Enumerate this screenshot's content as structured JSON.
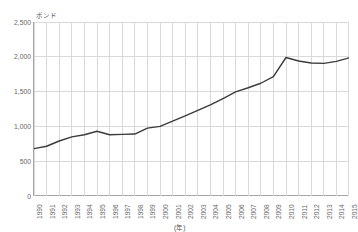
{
  "chart_data": {
    "type": "line",
    "title": "",
    "subtitle": "",
    "ylabel": "ポンド",
    "xlabel": "(年)",
    "ylim": [
      0,
      2500
    ],
    "yticks": [
      "0",
      "500",
      "1,000",
      "1,500",
      "2,000",
      "2,500"
    ],
    "ytick_values": [
      0,
      500,
      1000,
      1500,
      2000,
      2500
    ],
    "grid": true,
    "grid_x": true,
    "grid_y": true,
    "legend": false,
    "legend_position": "none",
    "line_color": "#3b3b3b",
    "grid_color": "#d9d9d9",
    "axis_color": "#a6a6a6",
    "categories": [
      "1990",
      "1991",
      "1992",
      "1993",
      "1994",
      "1995",
      "1996",
      "1997",
      "1998",
      "1999",
      "2000",
      "2001",
      "2002",
      "2003",
      "2004",
      "2005",
      "2006",
      "2007",
      "2008",
      "2009",
      "2010",
      "2011",
      "2012",
      "2013",
      "2014",
      "2015"
    ],
    "values": [
      680,
      715,
      790,
      850,
      880,
      930,
      880,
      885,
      890,
      975,
      1000,
      1075,
      1150,
      1230,
      1310,
      1400,
      1495,
      1555,
      1620,
      1715,
      1990,
      1940,
      1910,
      1905,
      1935,
      1985
    ],
    "series": [
      {
        "name": "ポンド",
        "values": [
          680,
          715,
          790,
          850,
          880,
          930,
          880,
          885,
          890,
          975,
          1000,
          1075,
          1150,
          1230,
          1310,
          1400,
          1495,
          1555,
          1620,
          1715,
          1990,
          1940,
          1910,
          1905,
          1935,
          1985
        ]
      }
    ]
  },
  "axis": {
    "unit_caption": "ポンド",
    "year_caption": "(年)"
  }
}
